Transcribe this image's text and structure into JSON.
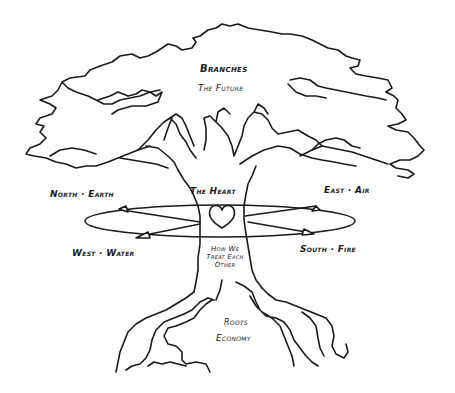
{
  "diagram": {
    "type": "hand-drawn tree metaphor",
    "colors": {
      "ink": "#1a1a1a",
      "background": "#ffffff"
    },
    "labels": {
      "branches": "Branches",
      "branches_sub": "The Future",
      "heart": "The Heart",
      "north": "North · Earth",
      "east": "East · Air",
      "west": "West · Water",
      "south": "South · Fire",
      "trunk_line1": "How We",
      "trunk_line2": "Treat Each",
      "trunk_line3": "Other",
      "roots": "Roots",
      "roots_sub": "Economy"
    }
  }
}
